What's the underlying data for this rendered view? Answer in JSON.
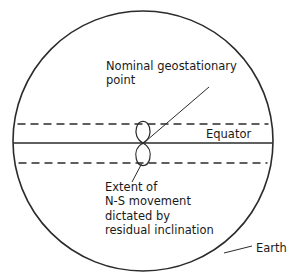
{
  "figure": {
    "kind": "diagram",
    "labels": {
      "nominal_point": "Nominal geostationary\npoint",
      "extent": "Extent of\nN-S movement\ndictated by\nresidual inclination",
      "equator": "Equator",
      "earth": "Earth"
    },
    "elements": {
      "earth_disc_name": "earth-circle",
      "equator_line_name": "equator-line",
      "north_limit_name": "north-limit-dashed-line",
      "south_limit_name": "south-limit-dashed-line",
      "analemma_name": "analemma-figure-eight"
    },
    "geometry": {
      "earth_center_x": 143,
      "earth_center_y": 141,
      "earth_radius": 130,
      "equator_y": 143,
      "north_dashed_y": 124,
      "south_dashed_y": 163,
      "analemma_center_x": 143,
      "analemma_top_y": 122,
      "analemma_bottom_y": 165,
      "analemma_half_width": 7
    },
    "colors": {
      "stroke": "#2b2b2b",
      "text": "#1a1a1a",
      "background": "#ffffff"
    },
    "strokes": {
      "earth_width": 1.5,
      "equator_width": 1.6,
      "dashed_width": 1.5,
      "dash_pattern": "8 5",
      "leader_width": 1.0
    }
  }
}
